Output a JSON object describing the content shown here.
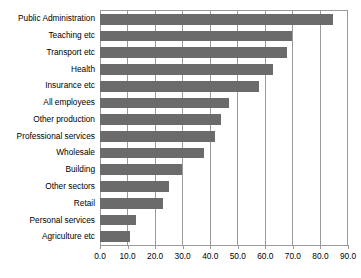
{
  "chart_data": {
    "type": "bar",
    "orientation": "horizontal",
    "title": "",
    "xlabel": "",
    "ylabel": "",
    "xlim": [
      0.0,
      90.0
    ],
    "grid": true,
    "legend": false,
    "xticks": [
      "0.0",
      "10.0",
      "20.0",
      "30.0",
      "40.0",
      "50.0",
      "60.0",
      "70.0",
      "80.0",
      "90.0"
    ],
    "xtick_values": [
      0,
      10,
      20,
      30,
      40,
      50,
      60,
      70,
      80,
      90
    ],
    "categories": [
      "Public Administration",
      "Teaching etc",
      "Transport etc",
      "Health",
      "Insurance etc",
      "All employees",
      "Other production",
      "Professional services",
      "Wholesale",
      "Building",
      "Other sectors",
      "Retail",
      "Personal services",
      "Agriculture etc"
    ],
    "values": [
      85,
      70,
      68,
      63,
      58,
      47,
      44,
      42,
      38,
      30,
      25,
      23,
      13,
      11
    ],
    "bar_color": "#6b6b6b",
    "grid_color": "#9a9a9a",
    "background_color": "#ffffff"
  }
}
